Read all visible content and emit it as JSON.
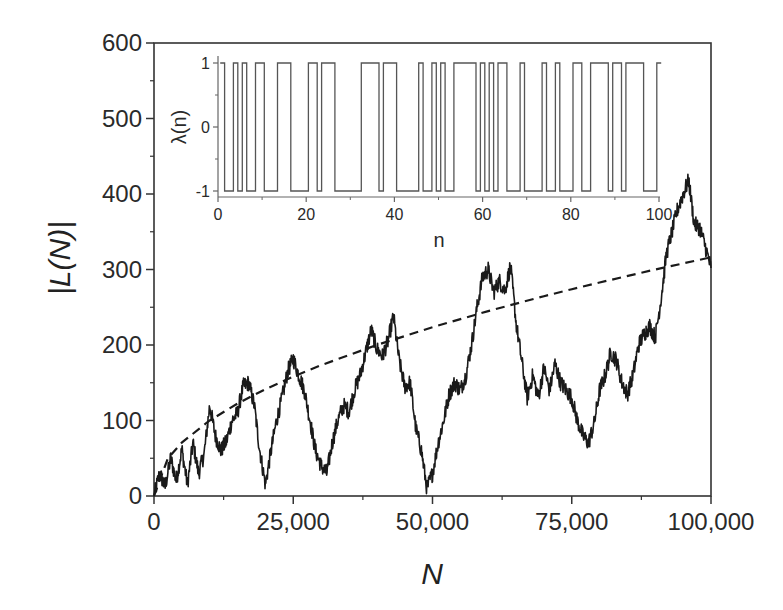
{
  "chart_data": [
    {
      "id": "main",
      "type": "line",
      "title": "",
      "xlabel": "N",
      "ylabel": "|L(N)|",
      "xlim": [
        0,
        100000
      ],
      "ylim": [
        0,
        600
      ],
      "x_ticks": [
        0,
        25000,
        50000,
        75000,
        100000
      ],
      "x_tick_labels": [
        "0",
        "25,000",
        "50,000",
        "75,000",
        "100,000"
      ],
      "y_ticks": [
        0,
        100,
        200,
        300,
        400,
        500,
        600
      ],
      "y_tick_labels": [
        "0",
        "100",
        "200",
        "300",
        "400",
        "500",
        "600"
      ],
      "grid": false,
      "legend": null,
      "series": [
        {
          "name": "|L(N)|",
          "style": "solid",
          "color": "#1a1a1a",
          "x": [
            0,
            1000,
            2000,
            3000,
            4000,
            5000,
            6000,
            7000,
            8000,
            9000,
            10000,
            11000,
            12000,
            13000,
            14000,
            15000,
            16000,
            17000,
            18000,
            19000,
            20000,
            21000,
            22000,
            23000,
            24000,
            25000,
            26000,
            27000,
            28000,
            29000,
            30000,
            31000,
            32000,
            33000,
            34000,
            35000,
            36000,
            37000,
            38000,
            39000,
            40000,
            41000,
            42000,
            43000,
            44000,
            45000,
            46000,
            47000,
            48000,
            49000,
            50000,
            51000,
            52000,
            53000,
            54000,
            55000,
            56000,
            57000,
            58000,
            59000,
            60000,
            61000,
            62000,
            63000,
            64000,
            65000,
            66000,
            67000,
            68000,
            69000,
            70000,
            71000,
            72000,
            73000,
            74000,
            75000,
            76000,
            77000,
            78000,
            79000,
            80000,
            81000,
            82000,
            83000,
            84000,
            85000,
            86000,
            87000,
            88000,
            89000,
            90000,
            91000,
            92000,
            93000,
            94000,
            95000,
            96000,
            97000,
            98000,
            99000,
            100000
          ],
          "y": [
            0,
            30,
            12,
            50,
            20,
            62,
            15,
            70,
            30,
            55,
            120,
            80,
            60,
            72,
            100,
            110,
            145,
            150,
            120,
            60,
            15,
            60,
            100,
            130,
            165,
            182,
            160,
            140,
            100,
            60,
            40,
            30,
            70,
            100,
            120,
            112,
            140,
            160,
            190,
            220,
            195,
            185,
            205,
            238,
            180,
            145,
            150,
            90,
            60,
            10,
            30,
            70,
            100,
            135,
            150,
            140,
            160,
            200,
            250,
            290,
            300,
            270,
            285,
            272,
            305,
            230,
            180,
            130,
            160,
            130,
            170,
            140,
            175,
            150,
            140,
            130,
            100,
            80,
            70,
            95,
            140,
            160,
            190,
            180,
            150,
            135,
            160,
            200,
            215,
            225,
            210,
            260,
            320,
            350,
            380,
            400,
            418,
            360,
            355,
            330,
            302
          ]
        },
        {
          "name": "sqrt(N)",
          "style": "dashed",
          "color": "#1a1a1a",
          "x": [
            0,
            2500,
            5000,
            10000,
            15000,
            20000,
            25000,
            30000,
            40000,
            50000,
            60000,
            70000,
            75000,
            80000,
            90000,
            100000
          ],
          "y": [
            0,
            50,
            70.7,
            100,
            122.5,
            141.4,
            158.1,
            173.2,
            200,
            223.6,
            244.9,
            264.6,
            273.9,
            282.8,
            300,
            316.2
          ]
        }
      ]
    },
    {
      "id": "inset",
      "type": "line",
      "title": "",
      "xlabel": "n",
      "ylabel": "λ(n)",
      "xlim": [
        0,
        100
      ],
      "ylim": [
        -1,
        1
      ],
      "x_ticks": [
        0,
        20,
        40,
        60,
        80,
        100
      ],
      "x_tick_labels": [
        "0",
        "20",
        "40",
        "60",
        "80",
        "100"
      ],
      "y_ticks": [
        -1,
        0,
        1
      ],
      "y_tick_labels": [
        "-1",
        "0",
        "1"
      ],
      "grid": false,
      "series": [
        {
          "name": "λ(n)",
          "style": "step",
          "color": "#555555",
          "n": [
            1,
            2,
            3,
            4,
            5,
            6,
            7,
            8,
            9,
            10,
            11,
            12,
            13,
            14,
            15,
            16,
            17,
            18,
            19,
            20,
            21,
            22,
            23,
            24,
            25,
            26,
            27,
            28,
            29,
            30,
            31,
            32,
            33,
            34,
            35,
            36,
            37,
            38,
            39,
            40,
            41,
            42,
            43,
            44,
            45,
            46,
            47,
            48,
            49,
            50,
            51,
            52,
            53,
            54,
            55,
            56,
            57,
            58,
            59,
            60,
            61,
            62,
            63,
            64,
            65,
            66,
            67,
            68,
            69,
            70,
            71,
            72,
            73,
            74,
            75,
            76,
            77,
            78,
            79,
            80,
            81,
            82,
            83,
            84,
            85,
            86,
            87,
            88,
            89,
            90,
            91,
            92,
            93,
            94,
            95,
            96,
            97,
            98,
            99,
            100
          ],
          "values": [
            1,
            -1,
            -1,
            1,
            -1,
            1,
            -1,
            -1,
            1,
            1,
            -1,
            -1,
            -1,
            1,
            1,
            1,
            -1,
            -1,
            -1,
            -1,
            1,
            1,
            -1,
            1,
            1,
            1,
            -1,
            -1,
            -1,
            -1,
            -1,
            -1,
            1,
            1,
            1,
            1,
            -1,
            1,
            1,
            1,
            -1,
            -1,
            -1,
            -1,
            -1,
            1,
            -1,
            -1,
            1,
            -1,
            1,
            -1,
            -1,
            1,
            1,
            1,
            1,
            1,
            -1,
            1,
            -1,
            1,
            -1,
            1,
            1,
            -1,
            -1,
            -1,
            1,
            -1,
            -1,
            -1,
            -1,
            1,
            -1,
            -1,
            1,
            -1,
            -1,
            -1,
            1,
            1,
            -1,
            -1,
            1,
            1,
            1,
            1,
            -1,
            1,
            1,
            -1,
            1,
            1,
            1,
            1,
            -1,
            -1,
            -1,
            1
          ]
        }
      ]
    }
  ],
  "labels": {
    "main_xlabel": "N",
    "main_ylabel": "|L(N)|",
    "inset_xlabel": "n",
    "inset_ylabel": "λ(n)"
  }
}
